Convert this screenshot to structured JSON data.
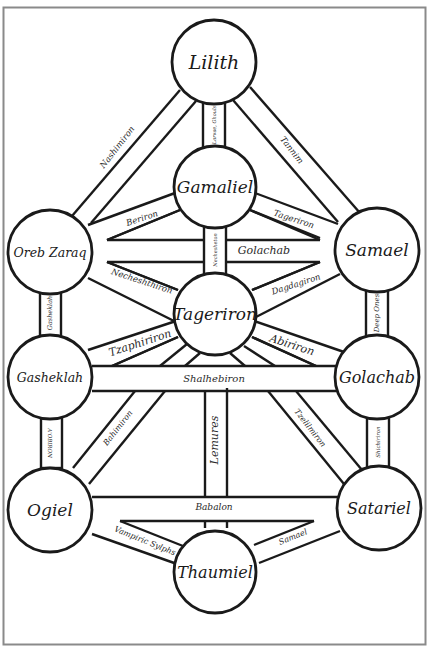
{
  "diagram": {
    "title": "",
    "type": "qliphothic-tree",
    "colors": {
      "line": "#1a1a1a",
      "frame": "#8a8a8a",
      "background": "#ffffff"
    },
    "nodes": [
      {
        "id": "lilith",
        "label": "Lilith",
        "cx": 214,
        "cy": 62,
        "r": 42,
        "fs": 19
      },
      {
        "id": "gamaliel",
        "label": "Gamaliel",
        "cx": 215,
        "cy": 187,
        "r": 41,
        "fs": 17
      },
      {
        "id": "oreb-zaraq",
        "label": "Oreb Zaraq",
        "cx": 50,
        "cy": 252,
        "r": 42,
        "fs": 12.5
      },
      {
        "id": "samael",
        "label": "Samael",
        "cx": 377,
        "cy": 250,
        "r": 42,
        "fs": 17
      },
      {
        "id": "tageriron",
        "label": "Tageriron",
        "cx": 215,
        "cy": 314,
        "r": 41,
        "fs": 17
      },
      {
        "id": "gasheklah",
        "label": "Gasheklah",
        "cx": 50,
        "cy": 377,
        "r": 42,
        "fs": 12.5
      },
      {
        "id": "golachab",
        "label": "Golachab",
        "cx": 377,
        "cy": 377,
        "r": 42,
        "fs": 16
      },
      {
        "id": "ogiel",
        "label": "Ogiel",
        "cx": 50,
        "cy": 510,
        "r": 42,
        "fs": 17
      },
      {
        "id": "satariel",
        "label": "Satariel",
        "cx": 379,
        "cy": 508,
        "r": 42,
        "fs": 16
      },
      {
        "id": "thaumiel",
        "label": "Thaumiel",
        "cx": 215,
        "cy": 572,
        "r": 41,
        "fs": 16
      }
    ],
    "paths": [
      {
        "id": "nashimiron",
        "label": "Nashimiron",
        "x": 117,
        "y": 147,
        "rot": -52,
        "fs": 8.5
      },
      {
        "id": "tannim",
        "label": "Tannim",
        "x": 292,
        "y": 150,
        "rot": 52,
        "fs": 8.5
      },
      {
        "id": "larvae-ghouls",
        "label": "Larvae, Ghouls",
        "x": 214,
        "y": 125,
        "rot": -90,
        "fs": 5
      },
      {
        "id": "beriron",
        "label": "Beriron",
        "x": 142,
        "y": 218,
        "rot": -18,
        "fs": 8.5
      },
      {
        "id": "tageriron-path",
        "label": "Tageriron",
        "x": 294,
        "y": 219,
        "rot": 18,
        "fs": 8.5
      },
      {
        "id": "golachab-path",
        "label": "Golachab",
        "x": 264,
        "y": 250,
        "rot": 0,
        "fs": 11
      },
      {
        "id": "nechesheton",
        "label": "Nechesheton",
        "x": 215,
        "y": 250,
        "rot": -90,
        "fs": 5
      },
      {
        "id": "necheshthiron",
        "label": "Necheshthiron",
        "x": 142,
        "y": 281,
        "rot": 18,
        "fs": 8.5
      },
      {
        "id": "dagdagiron",
        "label": "Dagdagiron",
        "x": 296,
        "y": 284,
        "rot": -18,
        "fs": 8.5
      },
      {
        "id": "gasheklah-path",
        "label": "Gasheklah",
        "x": 50,
        "y": 313,
        "rot": -90,
        "fs": 6.5
      },
      {
        "id": "deep-ones",
        "label": "Deep Ones",
        "x": 377,
        "y": 313,
        "rot": -90,
        "fs": 7
      },
      {
        "id": "tzaphiriron",
        "label": "Tzaphiriron",
        "x": 140,
        "y": 343,
        "rot": -18,
        "fs": 11
      },
      {
        "id": "abiriron",
        "label": "Abiriron",
        "x": 292,
        "y": 345,
        "rot": 18,
        "fs": 11
      },
      {
        "id": "shalhebiron",
        "label": "Shalhebiron",
        "x": 214,
        "y": 378,
        "rot": 0,
        "fs": 10
      },
      {
        "id": "a-ob-ron",
        "label": "A'OBIRON",
        "x": 50,
        "y": 443,
        "rot": 90,
        "fs": 5.5
      },
      {
        "id": "bahimiron",
        "label": "Bahimiron",
        "x": 118,
        "y": 428,
        "rot": -52,
        "fs": 8
      },
      {
        "id": "lemures",
        "label": "Lemures",
        "x": 214,
        "y": 440,
        "rot": -90,
        "fs": 11
      },
      {
        "id": "tzelilmiron",
        "label": "Tzelilmiron",
        "x": 310,
        "y": 428,
        "rot": 52,
        "fs": 8
      },
      {
        "id": "shichiriron",
        "label": "Shichiriron",
        "x": 378,
        "y": 442,
        "rot": -90,
        "fs": 5.5
      },
      {
        "id": "babalon",
        "label": "Babalon",
        "x": 214,
        "y": 507,
        "rot": 0,
        "fs": 9
      },
      {
        "id": "vampiric-sylphs",
        "label": "Vampiric Sylphs",
        "x": 145,
        "y": 541,
        "rot": 22,
        "fs": 8
      },
      {
        "id": "samael-path",
        "label": "Samael",
        "x": 293,
        "y": 537,
        "rot": -22,
        "fs": 8
      }
    ]
  },
  "chart_data": {
    "type": "diagram",
    "title": "",
    "nodes": [
      "Lilith",
      "Gamaliel",
      "Oreb Zaraq",
      "Samael",
      "Tageriron",
      "Gasheklah",
      "Golachab",
      "Ogiel",
      "Satariel",
      "Thaumiel"
    ],
    "edges": [
      {
        "from": "Lilith",
        "to": "Oreb Zaraq",
        "label": "Nashimiron"
      },
      {
        "from": "Lilith",
        "to": "Samael",
        "label": "Tannim"
      },
      {
        "from": "Lilith",
        "to": "Gamaliel",
        "label": "Larvae, Ghouls"
      },
      {
        "from": "Gamaliel",
        "to": "Oreb Zaraq",
        "label": "Beriron"
      },
      {
        "from": "Gamaliel",
        "to": "Samael",
        "label": "Tageriron"
      },
      {
        "from": "Gamaliel",
        "to": "Tageriron",
        "label": "Nechesheton"
      },
      {
        "from": "Oreb Zaraq",
        "to": "Samael",
        "label": "Golachab"
      },
      {
        "from": "Oreb Zaraq",
        "to": "Tageriron",
        "label": "Necheshthiron"
      },
      {
        "from": "Samael",
        "to": "Tageriron",
        "label": "Dagdagiron"
      },
      {
        "from": "Oreb Zaraq",
        "to": "Gasheklah",
        "label": "Gasheklah"
      },
      {
        "from": "Samael",
        "to": "Golachab",
        "label": "Deep Ones"
      },
      {
        "from": "Tageriron",
        "to": "Gasheklah",
        "label": "Tzaphiriron"
      },
      {
        "from": "Tageriron",
        "to": "Golachab",
        "label": "Abiriron"
      },
      {
        "from": "Gasheklah",
        "to": "Golachab",
        "label": "Shalhebiron"
      },
      {
        "from": "Gasheklah",
        "to": "Ogiel",
        "label": "A'OBIRON"
      },
      {
        "from": "Tageriron",
        "to": "Ogiel",
        "label": "Bahimiron"
      },
      {
        "from": "Tageriron",
        "to": "Thaumiel",
        "label": "Lemures"
      },
      {
        "from": "Tageriron",
        "to": "Satariel",
        "label": "Tzelilmiron"
      },
      {
        "from": "Golachab",
        "to": "Satariel",
        "label": "Shichiriron"
      },
      {
        "from": "Ogiel",
        "to": "Satariel",
        "label": "Babalon"
      },
      {
        "from": "Ogiel",
        "to": "Thaumiel",
        "label": "Vampiric Sylphs"
      },
      {
        "from": "Satariel",
        "to": "Thaumiel",
        "label": "Samael"
      }
    ]
  }
}
